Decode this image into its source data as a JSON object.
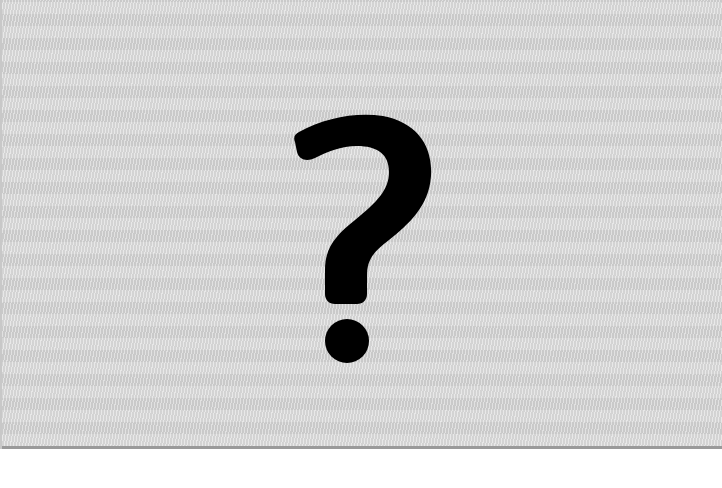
{
  "placeholder": {
    "kind": "missing-image-placeholder",
    "glyph": "?",
    "icon": "question-mark-icon",
    "colors": {
      "background": "#d8d8d8",
      "glyph": "#000000",
      "border_bottom": "#9a9a9a",
      "page": "#ffffff"
    }
  }
}
